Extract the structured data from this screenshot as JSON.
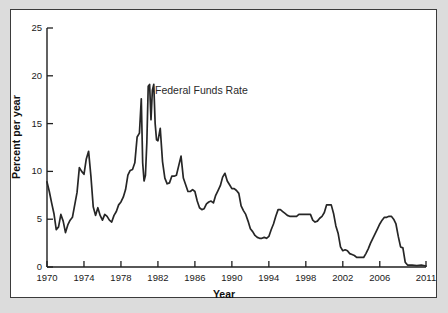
{
  "chart_data": {
    "type": "line",
    "title": "",
    "xlabel": "Year",
    "ylabel": "Percent per year",
    "xlim": [
      1970,
      2011
    ],
    "ylim": [
      0,
      25
    ],
    "grid": false,
    "legend_position": "inline-annotation",
    "xticks": [
      "1970",
      "1974",
      "1978",
      "1982",
      "1986",
      "1990",
      "1994",
      "1998",
      "2002",
      "2006",
      "2011"
    ],
    "xtick_values": [
      1970,
      1974,
      1978,
      1982,
      1986,
      1990,
      1994,
      1998,
      2002,
      2006,
      2011
    ],
    "yticks": [
      "0",
      "5",
      "10",
      "15",
      "20",
      "25"
    ],
    "ytick_values": [
      0,
      5,
      10,
      15,
      20,
      25
    ],
    "series": [
      {
        "name": "Federal Funds Rate",
        "color": "#262626",
        "annotation": "Federal Funds Rate",
        "x": [
          1970.0,
          1970.25,
          1970.5,
          1970.75,
          1971.0,
          1971.25,
          1971.5,
          1971.75,
          1972.0,
          1972.25,
          1972.5,
          1972.75,
          1973.0,
          1973.25,
          1973.5,
          1973.75,
          1974.0,
          1974.25,
          1974.5,
          1974.75,
          1975.0,
          1975.25,
          1975.5,
          1975.75,
          1976.0,
          1976.25,
          1976.5,
          1976.75,
          1977.0,
          1977.25,
          1977.5,
          1977.75,
          1978.0,
          1978.25,
          1978.5,
          1978.75,
          1979.0,
          1979.25,
          1979.5,
          1979.75,
          1980.0,
          1980.2,
          1980.35,
          1980.5,
          1980.65,
          1980.8,
          1980.95,
          1981.1,
          1981.25,
          1981.4,
          1981.55,
          1981.7,
          1981.85,
          1982.0,
          1982.25,
          1982.5,
          1982.75,
          1983.0,
          1983.25,
          1983.5,
          1983.75,
          1984.0,
          1984.25,
          1984.5,
          1984.75,
          1985.0,
          1985.25,
          1985.5,
          1985.75,
          1986.0,
          1986.25,
          1986.5,
          1986.75,
          1987.0,
          1987.25,
          1987.5,
          1987.75,
          1988.0,
          1988.25,
          1988.5,
          1988.75,
          1989.0,
          1989.25,
          1989.5,
          1989.75,
          1990.0,
          1990.25,
          1990.5,
          1990.75,
          1991.0,
          1991.25,
          1991.5,
          1991.75,
          1992.0,
          1992.25,
          1992.5,
          1992.75,
          1993.0,
          1993.25,
          1993.5,
          1993.75,
          1994.0,
          1994.25,
          1994.5,
          1994.75,
          1995.0,
          1995.25,
          1995.5,
          1995.75,
          1996.0,
          1996.25,
          1996.5,
          1996.75,
          1997.0,
          1997.25,
          1997.5,
          1997.75,
          1998.0,
          1998.25,
          1998.5,
          1998.75,
          1999.0,
          1999.25,
          1999.5,
          1999.75,
          2000.0,
          2000.25,
          2000.5,
          2000.75,
          2001.0,
          2001.25,
          2001.5,
          2001.75,
          2002.0,
          2002.25,
          2002.5,
          2002.75,
          2003.0,
          2003.25,
          2003.5,
          2003.75,
          2004.0,
          2004.25,
          2004.5,
          2004.75,
          2005.0,
          2005.25,
          2005.5,
          2005.75,
          2006.0,
          2006.25,
          2006.5,
          2006.75,
          2007.0,
          2007.25,
          2007.5,
          2007.75,
          2008.0,
          2008.25,
          2008.5,
          2008.75,
          2009.0,
          2009.5,
          2010.0,
          2010.5,
          2011.0
        ],
        "y": [
          8.9,
          7.9,
          6.7,
          5.6,
          3.9,
          4.2,
          5.5,
          4.8,
          3.6,
          4.4,
          4.9,
          5.2,
          6.5,
          7.8,
          10.4,
          10.0,
          9.7,
          11.3,
          12.1,
          9.5,
          6.3,
          5.4,
          6.2,
          5.4,
          4.9,
          5.5,
          5.3,
          4.9,
          4.7,
          5.4,
          5.8,
          6.5,
          6.8,
          7.3,
          8.1,
          9.6,
          10.1,
          10.2,
          10.9,
          13.6,
          14.0,
          17.6,
          10.9,
          9.0,
          9.6,
          13.0,
          18.9,
          19.1,
          15.4,
          18.5,
          19.1,
          15.0,
          13.3,
          13.2,
          14.5,
          11.0,
          9.3,
          8.7,
          8.8,
          9.5,
          9.5,
          9.6,
          10.6,
          11.6,
          9.3,
          8.6,
          7.9,
          7.9,
          8.1,
          7.9,
          6.9,
          6.2,
          6.0,
          6.1,
          6.6,
          6.8,
          6.9,
          6.7,
          7.5,
          8.0,
          8.5,
          9.4,
          9.8,
          9.0,
          8.6,
          8.2,
          8.2,
          8.0,
          7.7,
          6.4,
          5.9,
          5.5,
          4.8,
          4.0,
          3.7,
          3.3,
          3.1,
          3.0,
          3.0,
          3.1,
          3.0,
          3.2,
          3.9,
          4.5,
          5.3,
          6.0,
          6.0,
          5.8,
          5.6,
          5.4,
          5.3,
          5.3,
          5.3,
          5.3,
          5.5,
          5.5,
          5.5,
          5.5,
          5.5,
          5.5,
          4.9,
          4.7,
          4.8,
          5.1,
          5.3,
          5.7,
          6.5,
          6.5,
          6.5,
          5.6,
          4.3,
          3.5,
          2.1,
          1.7,
          1.8,
          1.7,
          1.4,
          1.3,
          1.2,
          1.0,
          1.0,
          1.0,
          1.0,
          1.4,
          1.9,
          2.5,
          3.0,
          3.5,
          4.0,
          4.5,
          4.9,
          5.2,
          5.2,
          5.3,
          5.3,
          5.0,
          4.5,
          3.2,
          2.1,
          2.0,
          0.5,
          0.2,
          0.2,
          0.15,
          0.2,
          0.1
        ]
      }
    ]
  },
  "axis": {
    "ylabel_text": "Percent per year",
    "xlabel_text": "Year"
  },
  "annotation": {
    "series_label": "Federal Funds Rate"
  },
  "colors": {
    "line": "#262626",
    "axis": "#1f1f1f",
    "frame_border": "#3b3b3b",
    "plot_background": "#ffffff",
    "page_background": "#dcdcdc"
  }
}
